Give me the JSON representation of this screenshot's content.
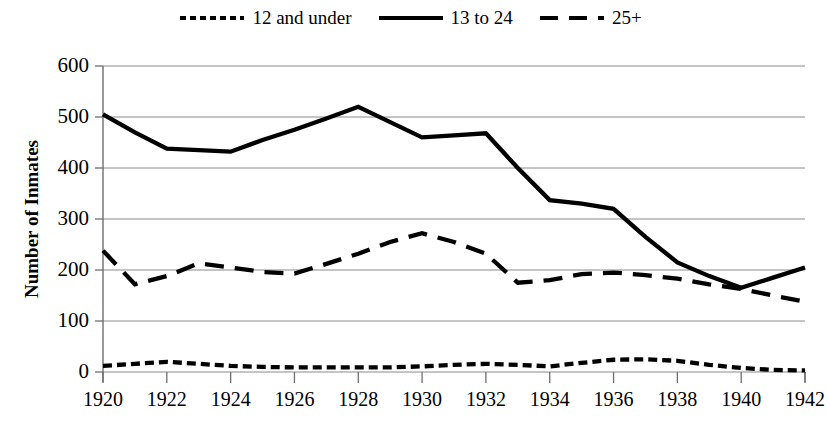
{
  "chart_data": {
    "type": "line",
    "title": "",
    "xlabel": "",
    "ylabel": "Number of Inmates",
    "ylim": [
      0,
      600
    ],
    "ytick_labels": [
      "600",
      "500",
      "400",
      "300",
      "200",
      "100",
      "0"
    ],
    "ytick_values": [
      600,
      500,
      400,
      300,
      200,
      100,
      0
    ],
    "xlim": [
      1920,
      1942
    ],
    "xtick_labels": [
      "1920",
      "1922",
      "1924",
      "1926",
      "1928",
      "1930",
      "1932",
      "1934",
      "1936",
      "1938",
      "1940",
      "1942"
    ],
    "xtick_values": [
      1920,
      1922,
      1924,
      1926,
      1928,
      1930,
      1932,
      1934,
      1936,
      1938,
      1940,
      1942
    ],
    "x": [
      1920,
      1921,
      1922,
      1923,
      1924,
      1925,
      1926,
      1927,
      1928,
      1929,
      1930,
      1931,
      1932,
      1933,
      1934,
      1935,
      1936,
      1937,
      1938,
      1939,
      1940,
      1941,
      1942
    ],
    "grid": "horizontal",
    "legend_position": "top-center",
    "series": [
      {
        "name": "12 and under",
        "style": "dotted",
        "color": "#000000",
        "values": [
          12,
          16,
          20,
          16,
          12,
          10,
          9,
          9,
          9,
          9,
          11,
          14,
          16,
          14,
          11,
          18,
          24,
          25,
          22,
          14,
          8,
          4,
          3
        ]
      },
      {
        "name": "13 to 24",
        "style": "solid",
        "color": "#000000",
        "values": [
          505,
          470,
          438,
          435,
          432,
          455,
          475,
          497,
          520,
          490,
          460,
          464,
          468,
          400,
          337,
          330,
          320,
          265,
          215,
          188,
          165,
          185,
          205
        ]
      },
      {
        "name": "25+",
        "style": "dashed",
        "color": "#000000",
        "values": [
          238,
          172,
          188,
          213,
          205,
          196,
          193,
          212,
          232,
          255,
          272,
          255,
          232,
          175,
          180,
          192,
          195,
          190,
          183,
          172,
          163,
          150,
          138
        ]
      }
    ]
  },
  "legend": {
    "items": [
      {
        "label": "12 and under",
        "key": "dotted-line-key"
      },
      {
        "label": "13 to 24",
        "key": "solid-line-key"
      },
      {
        "label": "25+",
        "key": "dashed-line-key"
      }
    ]
  },
  "axes": {
    "y_title": "Number of Inmates"
  }
}
